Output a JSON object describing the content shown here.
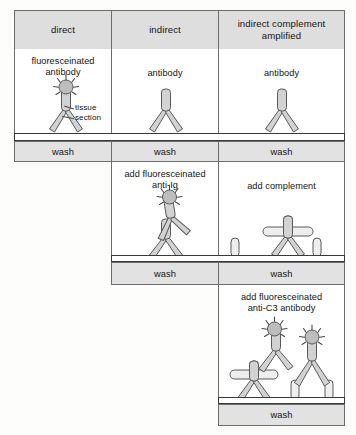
{
  "diagram": {
    "columns": [
      {
        "id": "direct",
        "header": "direct"
      },
      {
        "id": "indirect",
        "header": "indirect"
      },
      {
        "id": "amplified",
        "header": "indirect complement\namplified"
      }
    ],
    "header_line1_col3": "indirect complement",
    "header_line2_col3": "amplified",
    "labels": {
      "tissue_section_line1": "tissue",
      "tissue_section_line2": "section",
      "wash": "wash"
    },
    "steps": {
      "direct": [
        {
          "caption_line1": "fluoresceinated",
          "caption_line2": "antibody",
          "kind": "fluor-antibody"
        },
        {
          "caption_line1": "wash",
          "kind": "wash"
        }
      ],
      "indirect": [
        {
          "caption_line1": "antibody",
          "caption_line2": "",
          "kind": "antibody"
        },
        {
          "caption_line1": "wash",
          "kind": "wash"
        },
        {
          "caption_line1": "add fluoresceinated",
          "caption_line2": "anti-Ig",
          "kind": "fluor-anti-ig"
        },
        {
          "caption_line1": "wash",
          "kind": "wash"
        }
      ],
      "amplified": [
        {
          "caption_line1": "antibody",
          "caption_line2": "",
          "kind": "antibody"
        },
        {
          "caption_line1": "wash",
          "kind": "wash"
        },
        {
          "caption_line1": "add complement",
          "caption_line2": "",
          "kind": "complement"
        },
        {
          "caption_line1": "wash",
          "kind": "wash"
        },
        {
          "caption_line1": "add fluoresceinated",
          "caption_line2": "anti-C3 antibody",
          "kind": "fluor-anti-c3"
        },
        {
          "caption_line1": "wash",
          "kind": "wash"
        }
      ]
    },
    "colors": {
      "header_fill": "#dedede",
      "wash_fill": "#e2e2e2",
      "panel_fill": "#ffffff",
      "stroke": "#6d6d6d",
      "molecule_fill": "#d2d2d2",
      "molecule_stroke": "#5a5a5a",
      "fluorophore_fill": "#bdbdbd",
      "tissue_fill": "#ffffff",
      "tissue_stroke": "#3a3a3a",
      "text": "#141414"
    }
  }
}
